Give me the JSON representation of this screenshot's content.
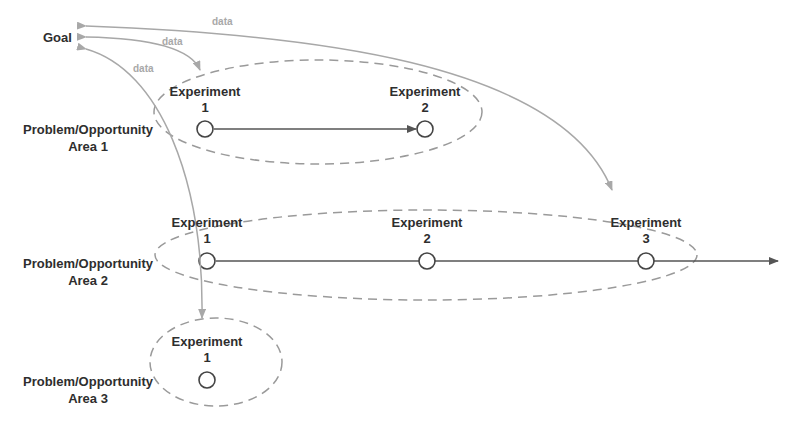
{
  "goal": {
    "label": "Goal"
  },
  "data_labels": [
    "data",
    "data",
    "data"
  ],
  "areas": [
    {
      "label_line1": "Problem/Opportunity",
      "label_line2": "Area 1",
      "experiments": [
        {
          "title": "Experiment",
          "number": "1"
        },
        {
          "title": "Experiment",
          "number": "2"
        }
      ]
    },
    {
      "label_line1": "Problem/Opportunity",
      "label_line2": "Area 2",
      "experiments": [
        {
          "title": "Experiment",
          "number": "1"
        },
        {
          "title": "Experiment",
          "number": "2"
        },
        {
          "title": "Experiment",
          "number": "3"
        }
      ]
    },
    {
      "label_line1": "Problem/Opportunity",
      "label_line2": "Area 3",
      "experiments": [
        {
          "title": "Experiment",
          "number": "1"
        }
      ]
    }
  ],
  "colors": {
    "text": "#2e2e2e",
    "data_arrow": "#a8a8a8",
    "timeline": "#555555",
    "dashed_ellipse": "#9a9a9a"
  }
}
